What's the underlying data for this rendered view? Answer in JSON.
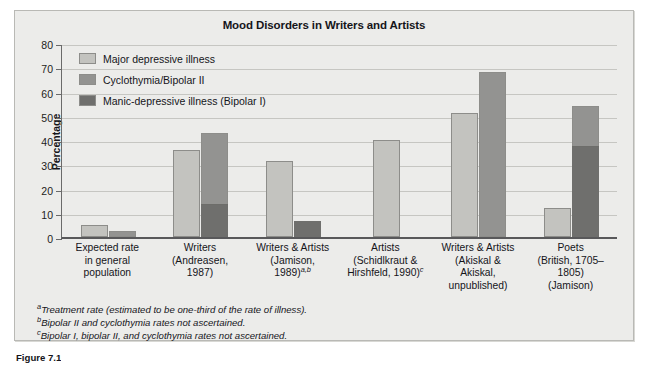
{
  "figure": {
    "caption": "Figure 7.1"
  },
  "chart_data": {
    "type": "bar",
    "title": "Mood Disorders in Writers and Artists",
    "xlabel": "",
    "ylabel": "Percentage",
    "ylim": [
      0,
      80
    ],
    "yticks": [
      0,
      10,
      20,
      30,
      40,
      50,
      60,
      70,
      80
    ],
    "grid": true,
    "legend_position": "top-left inside plot",
    "stacked": "partial",
    "categories": [
      "Expected rate in general population",
      "Writers (Andreasen, 1987)",
      "Writers & Artists (Jamison, 1989)",
      "Artists (Schidlkraut & Hirshfeld, 1990)",
      "Writers & Artists (Akiskal & Akiskal, unpublished)",
      "Poets (British, 1705–1805) (Jamison)"
    ],
    "category_lines": [
      [
        "Expected rate",
        "in general",
        "population"
      ],
      [
        "Writers",
        "(Andreasen,",
        "1987)"
      ],
      [
        "Writers & Artists",
        "(Jamison,",
        "1989)"
      ],
      [
        "Artists",
        "(Schidlkraut &",
        "Hirshfeld, 1990)"
      ],
      [
        "Writers & Artists",
        "(Akiskal &",
        "Akiskal,",
        "unpublished)"
      ],
      [
        "Poets",
        "(British, 1705–1805)",
        "(Jamison)"
      ]
    ],
    "category_superscripts": [
      "",
      "",
      "a,b",
      "c",
      "",
      ""
    ],
    "series": [
      {
        "name": "Major depressive illness",
        "color": "#c3c3bf",
        "values": [
          5,
          36,
          31.5,
          40,
          51,
          12
        ]
      },
      {
        "name": "Cyclothymia/Bipolar II",
        "color": "#939391",
        "values": [
          2.5,
          30,
          0,
          0,
          68,
          17
        ]
      },
      {
        "name": "Manic-depressive illness (Bipolar I)",
        "color": "#6f6f6d",
        "values": [
          0,
          13,
          6,
          0,
          0,
          37
        ]
      }
    ],
    "bar_tops": {
      "note": "second bar in each group is a stack of Bipolar I (bottom) + Cyclothymia/Bipolar II (top)",
      "group_totals": [
        {
          "light": 5,
          "stack_total": 2.5,
          "stack_dark": 0
        },
        {
          "light": 36,
          "stack_total": 43,
          "stack_dark": 13
        },
        {
          "light": 31.5,
          "stack_total": 6,
          "stack_dark": 6
        },
        {
          "light": 40,
          "stack_total": 0,
          "stack_dark": 0
        },
        {
          "light": 51,
          "stack_total": 68,
          "stack_dark": 0
        },
        {
          "light": 12,
          "stack_total": 54,
          "stack_dark": 37
        }
      ]
    },
    "footnotes": [
      {
        "marker": "a",
        "text": "Treatment rate (estimated to be one-third of the rate of illness)."
      },
      {
        "marker": "b",
        "text": "Bipolar II and cyclothymia rates not ascertained."
      },
      {
        "marker": "c",
        "text": "Bipolar I, bipolar II, and cyclothymia rates not ascertained."
      }
    ]
  },
  "colors": {
    "panel_background": "#ececea",
    "panel_border": "#b9b9b5",
    "gridline": "#c6c6c2",
    "axis": "#58585a",
    "text": "#15151a",
    "series_light": "#c3c3bf",
    "series_medium": "#939391",
    "series_dark": "#6f6f6d"
  }
}
